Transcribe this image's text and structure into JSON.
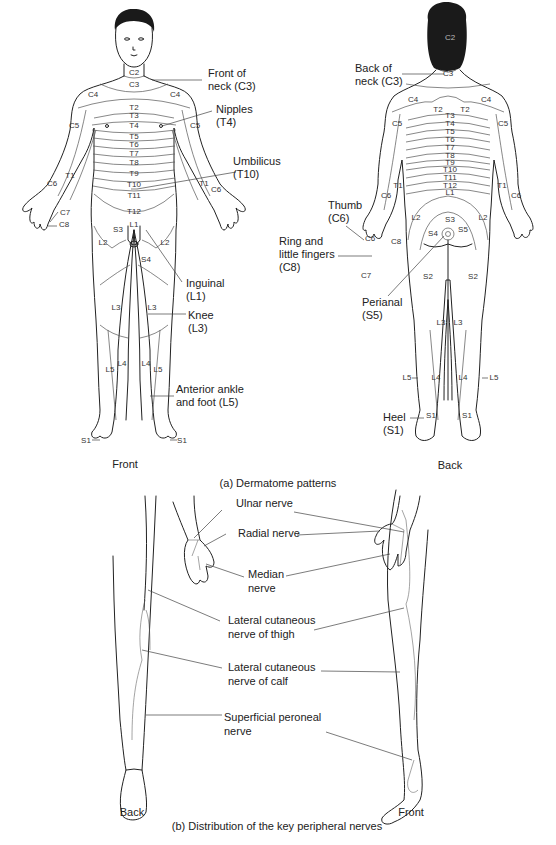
{
  "figure": {
    "part_a": {
      "caption": "(a) Dermatome patterns",
      "front": {
        "view_label": "Front",
        "segments": [
          "C2",
          "C3",
          "C4",
          "C4",
          "C5",
          "C5",
          "T2",
          "T3",
          "T4",
          "T5",
          "T6",
          "T7",
          "T8",
          "T9",
          "T10",
          "T11",
          "T12",
          "T1",
          "T1",
          "C6",
          "C6",
          "C7",
          "C8",
          "L1",
          "S3",
          "S4",
          "L2",
          "L2",
          "L3",
          "L3",
          "L4",
          "L4",
          "L5",
          "L5",
          "S1",
          "S1"
        ],
        "callouts": [
          {
            "line1": "Front of",
            "line2": "neck (C3)"
          },
          {
            "line1": "Nipples",
            "line2": "(T4)"
          },
          {
            "line1": "Umbilicus",
            "line2": "(T10)"
          },
          {
            "line1": "Inguinal",
            "line2": "(L1)"
          },
          {
            "line1": "Knee",
            "line2": "(L3)"
          },
          {
            "line1": "Anterior ankle",
            "line2": "and foot (L5)"
          }
        ]
      },
      "back": {
        "view_label": "Back",
        "segments": [
          "C2",
          "C3",
          "C4",
          "C4",
          "T2",
          "T2",
          "C5",
          "C5",
          "T3",
          "T4",
          "T5",
          "T6",
          "T7",
          "T8",
          "T9",
          "T10",
          "T11",
          "T12",
          "L1",
          "T1",
          "T1",
          "C6",
          "C6",
          "C6",
          "C8",
          "C7",
          "L2",
          "L2",
          "S3",
          "S4",
          "S5",
          "S2",
          "S2",
          "L3",
          "L3",
          "L4",
          "L4",
          "L5",
          "L5",
          "S1",
          "S1"
        ],
        "callouts": [
          {
            "line1": "Back of",
            "line2": "neck (C3)"
          },
          {
            "line1": "Thumb",
            "line2": "(C6)"
          },
          {
            "line1": "Ring and",
            "line2": "little fingers",
            "line3": "(C8)"
          },
          {
            "line1": "Perianal",
            "line2": "(S5)"
          },
          {
            "line1": "Heel",
            "line2": "(S1)"
          }
        ]
      }
    },
    "part_b": {
      "caption": "(b) Distribution of the key peripheral nerves",
      "back_label": "Back",
      "front_label": "Front",
      "callouts": [
        {
          "line1": "Ulnar nerve"
        },
        {
          "line1": "Radial nerve"
        },
        {
          "line1": "Median",
          "line2": "nerve"
        },
        {
          "line1": "Lateral cutaneous",
          "line2": "nerve of thigh"
        },
        {
          "line1": "Lateral cutaneous",
          "line2": "nerve of calf"
        },
        {
          "line1": "Superficial peroneal",
          "line2": "nerve"
        }
      ]
    }
  }
}
